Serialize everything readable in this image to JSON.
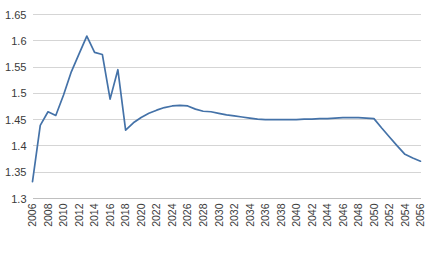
{
  "chart_data": {
    "type": "line",
    "title": "",
    "subtitle": "",
    "xlabel": "",
    "ylabel": "",
    "xlim": [
      2006,
      2056
    ],
    "ylim": [
      1.3,
      1.65
    ],
    "grid": true,
    "legend": false,
    "legend_position": "none",
    "y_ticks": [
      1.3,
      1.35,
      1.4,
      1.45,
      1.5,
      1.55,
      1.6,
      1.65
    ],
    "y_tick_labels": [
      "1.3",
      "1.35",
      "1.4",
      "1.45",
      "1.5",
      "1.55",
      "1.6",
      "1.65"
    ],
    "x_ticks": [
      2006,
      2008,
      2010,
      2012,
      2014,
      2016,
      2018,
      2020,
      2022,
      2024,
      2026,
      2028,
      2030,
      2032,
      2034,
      2036,
      2038,
      2040,
      2042,
      2044,
      2046,
      2048,
      2050,
      2052,
      2054,
      2056
    ],
    "x_tick_labels": [
      "2006",
      "2008",
      "2010",
      "2012",
      "2014",
      "2016",
      "2018",
      "2020",
      "2022",
      "2024",
      "2026",
      "2028",
      "2030",
      "2032",
      "2034",
      "2036",
      "2038",
      "2040",
      "2042",
      "2044",
      "2046",
      "2048",
      "2050",
      "2052",
      "2054",
      "2056"
    ],
    "series": [
      {
        "name": "series-1",
        "color": "#4472a8",
        "x": [
          2006,
          2007,
          2008,
          2009,
          2010,
          2011,
          2012,
          2013,
          2014,
          2015,
          2016,
          2017,
          2018,
          2019,
          2020,
          2021,
          2022,
          2023,
          2024,
          2025,
          2026,
          2027,
          2028,
          2029,
          2030,
          2031,
          2032,
          2033,
          2034,
          2035,
          2036,
          2037,
          2038,
          2039,
          2040,
          2041,
          2042,
          2043,
          2044,
          2045,
          2046,
          2047,
          2048,
          2049,
          2050,
          2051,
          2052,
          2053,
          2054,
          2055,
          2056
        ],
        "values": [
          1.332,
          1.439,
          1.465,
          1.458,
          1.497,
          1.541,
          1.575,
          1.609,
          1.578,
          1.574,
          1.489,
          1.545,
          1.43,
          1.444,
          1.454,
          1.462,
          1.468,
          1.473,
          1.476,
          1.477,
          1.476,
          1.47,
          1.466,
          1.465,
          1.462,
          1.459,
          1.457,
          1.455,
          1.453,
          1.451,
          1.45,
          1.45,
          1.45,
          1.45,
          1.45,
          1.451,
          1.451,
          1.452,
          1.452,
          1.453,
          1.454,
          1.454,
          1.454,
          1.453,
          1.452,
          1.434,
          1.417,
          1.4,
          1.384,
          1.377,
          1.371
        ]
      }
    ]
  }
}
